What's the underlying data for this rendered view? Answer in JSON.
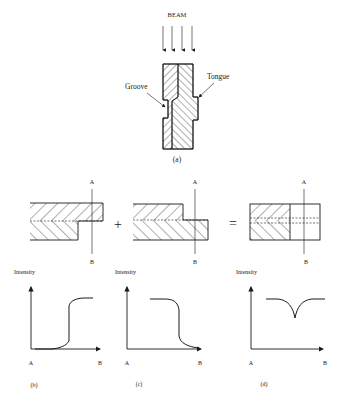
{
  "figure": {
    "panel_a": {
      "beam_label": "BEAM",
      "groove_label": "Groove",
      "tongue_label": "Tongue",
      "caption": "(a)",
      "arrow_count": 4
    },
    "cross_sections": {
      "operator_plus": "+",
      "operator_equals": "=",
      "items": [
        {
          "a_label": "A",
          "b_label": "B"
        },
        {
          "a_label": "A",
          "b_label": "B"
        },
        {
          "a_label": "A",
          "b_label": "B"
        }
      ]
    },
    "graphs": [
      {
        "ylabel": "Intensity",
        "x_start": "A",
        "x_end": "B",
        "caption": "(b)",
        "shape": "rising step"
      },
      {
        "ylabel": "Intensity",
        "x_start": "A",
        "x_end": "B",
        "caption": "(c)",
        "shape": "falling step"
      },
      {
        "ylabel": "Intensity",
        "x_start": "A",
        "x_end": "B",
        "caption": "(d)",
        "shape": "flat with cusp dip"
      }
    ]
  },
  "colors": {
    "ink": "#1a1a1a",
    "background": "#ffffff"
  }
}
